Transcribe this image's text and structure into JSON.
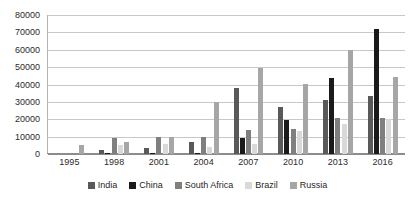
{
  "chart_data": {
    "type": "bar",
    "title": "",
    "subtitle": "",
    "xlabel": "",
    "ylabel": "",
    "categories": [
      "1995",
      "1998",
      "2001",
      "2004",
      "2007",
      "2010",
      "2013",
      "2016"
    ],
    "ylim": [
      0,
      80000
    ],
    "ytick_interval": 10000,
    "yticks": [
      "80000",
      "70000",
      "60000",
      "50000",
      "40000",
      "30000",
      "20000",
      "10000",
      "0"
    ],
    "ytick_values": [
      80000,
      70000,
      60000,
      50000,
      40000,
      30000,
      20000,
      10000,
      0
    ],
    "grid": true,
    "grid_axis": "y",
    "legend_position": "bottom",
    "series": [
      {
        "name": "India",
        "color": "#595959",
        "values": [
          0,
          2500,
          3500,
          6800,
          38000,
          27000,
          31000,
          33500
        ]
      },
      {
        "name": "China",
        "color": "#1a1a1a",
        "values": [
          0,
          700,
          300,
          600,
          9000,
          19500,
          43500,
          72000
        ]
      },
      {
        "name": "South Africa",
        "color": "#7f7f7f",
        "values": [
          0,
          9000,
          10000,
          9800,
          14000,
          14500,
          20500,
          20800
        ]
      },
      {
        "name": "Brazil",
        "color": "#d9d9d9",
        "values": [
          0,
          5300,
          5500,
          3800,
          5800,
          13500,
          17000,
          20000
        ]
      },
      {
        "name": "Russia",
        "color": "#a6a6a6",
        "values": [
          5200,
          6800,
          10000,
          30000,
          49500,
          40500,
          60000,
          44500
        ]
      }
    ]
  }
}
